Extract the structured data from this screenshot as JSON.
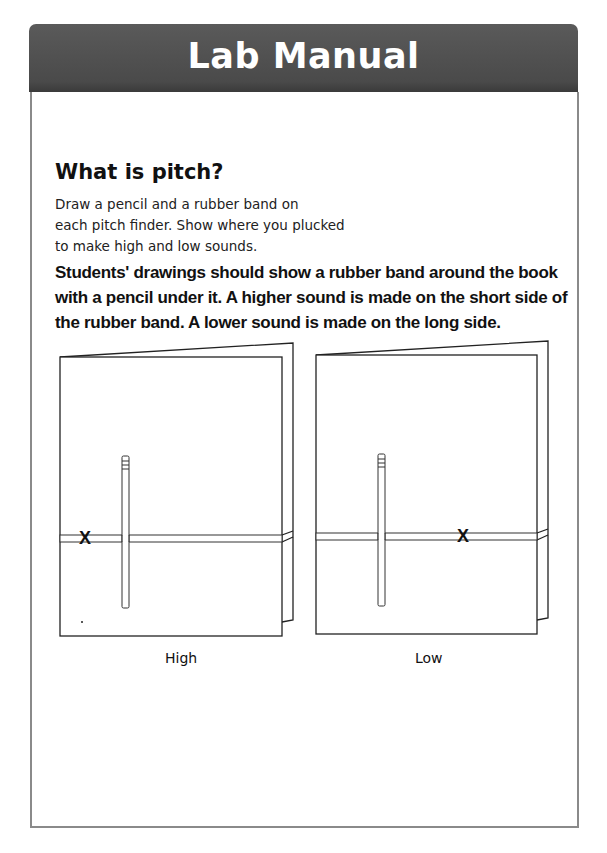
{
  "header": {
    "title": "Lab Manual"
  },
  "section": {
    "heading": "What is pitch?",
    "instructions": [
      "Draw a pencil and a rubber band on",
      "each pitch finder. Show where you plucked",
      "to make high and low sounds."
    ],
    "answer": "Students' drawings should show a rubber band around the book with a pencil under it. A higher sound is made on the short side of the rubber band. A lower sound is made on the long side."
  },
  "figures": [
    {
      "label": "High",
      "mark": "X"
    },
    {
      "label": "Low",
      "mark": "X"
    }
  ],
  "colors": {
    "header_bg": "#4f4f4f",
    "header_text": "#ffffff",
    "frame_border": "#8a8a8a"
  }
}
